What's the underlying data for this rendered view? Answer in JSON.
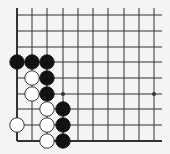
{
  "diagram": {
    "type": "go-board-fragment",
    "corner": "bottom-left",
    "colors": {
      "background": "#f4f4f4",
      "line": "#333333",
      "black_stone": "#111111",
      "white_stone": "#ffffff",
      "white_outline": "#222222"
    },
    "grid": {
      "x": [
        17,
        32,
        47,
        63,
        78,
        93,
        108,
        124,
        139,
        154
      ],
      "y": [
        15,
        31,
        47,
        62,
        78,
        94,
        109,
        125,
        141
      ],
      "line_top": 8,
      "line_right": 162
    },
    "star_points": [
      {
        "col": 3,
        "row": 5
      },
      {
        "col": 9,
        "row": 5
      }
    ],
    "stones": [
      {
        "color": "black",
        "col": 0,
        "row": 3
      },
      {
        "color": "black",
        "col": 1,
        "row": 3
      },
      {
        "color": "black",
        "col": 2,
        "row": 3
      },
      {
        "color": "white",
        "col": 1,
        "row": 4
      },
      {
        "color": "black",
        "col": 2,
        "row": 4
      },
      {
        "color": "white",
        "col": 1,
        "row": 5
      },
      {
        "color": "black",
        "col": 2,
        "row": 5
      },
      {
        "color": "white",
        "col": 2,
        "row": 6
      },
      {
        "color": "black",
        "col": 3,
        "row": 6
      },
      {
        "color": "white",
        "col": 0,
        "row": 7
      },
      {
        "color": "white",
        "col": 2,
        "row": 7
      },
      {
        "color": "black",
        "col": 3,
        "row": 7
      },
      {
        "color": "white",
        "col": 2,
        "row": 8
      },
      {
        "color": "black",
        "col": 3,
        "row": 8
      }
    ]
  }
}
